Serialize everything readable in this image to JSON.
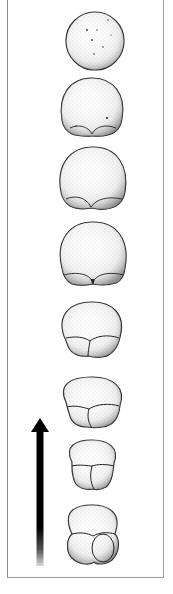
{
  "figure": {
    "stages": [
      {
        "index": 1,
        "name": "undivided-egg",
        "cx": 95,
        "cy": 41,
        "rx": 29,
        "ry": 29,
        "lobes": 0
      },
      {
        "index": 2,
        "name": "early-furrow",
        "cx": 92,
        "cy": 106,
        "rx": 31,
        "ry": 30,
        "lobes": 2
      },
      {
        "index": 3,
        "name": "furrow-deepening",
        "cx": 92,
        "cy": 177,
        "rx": 33,
        "ry": 31,
        "lobes": 2
      },
      {
        "index": 4,
        "name": "lobes-forming",
        "cx": 93,
        "cy": 252,
        "rx": 33,
        "ry": 31,
        "lobes": 2
      },
      {
        "index": 5,
        "name": "lobes-enlarging",
        "cx": 92,
        "cy": 326,
        "rx": 30,
        "ry": 25,
        "lobes": 2
      },
      {
        "index": 6,
        "name": "lobes-prominent",
        "cx": 92,
        "cy": 400,
        "rx": 29,
        "ry": 23,
        "lobes": 2
      },
      {
        "index": 7,
        "name": "late-stage",
        "cx": 92,
        "cy": 460,
        "rx": 22,
        "ry": 19,
        "lobes": 2
      },
      {
        "index": 8,
        "name": "final-stage",
        "cx": 92,
        "cy": 525,
        "rx": 25,
        "ry": 22,
        "lobes": 2
      }
    ],
    "arrow": {
      "direction": "up",
      "x": 40,
      "head_top": 418,
      "shaft_bottom": 566,
      "color": "#000000"
    },
    "colors": {
      "outline": "#1a1a1a",
      "stipple": "#555555",
      "frame": "#8a8a8a",
      "background": "#ffffff"
    }
  }
}
